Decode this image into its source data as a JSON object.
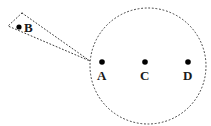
{
  "figure": {
    "background_color": "#ffffff",
    "stroke_color": "#3a3a3a",
    "dot_color": "#000000",
    "label_color": "#1a1a1a",
    "line_style": "dotted",
    "width": 211,
    "height": 126
  },
  "circle": {
    "name": "dotted-circle",
    "center_x": 148,
    "center_y": 66,
    "radius": 58,
    "stroke": "#3a3a3a",
    "stroke_width": 1,
    "dash": "1 2.6",
    "fill": "none"
  },
  "wedge": {
    "name": "dotted-wedge",
    "stroke": "#3a3a3a",
    "stroke_width": 1,
    "dash": "1 2.4",
    "fill": "none",
    "points": "22,13 8,26 90,61 90,61",
    "vertices": [
      {
        "label": "top-left",
        "x": 22,
        "y": 13
      },
      {
        "label": "bottom-left",
        "x": 8,
        "y": 26
      },
      {
        "label": "apex",
        "x": 90,
        "y": 61
      }
    ]
  },
  "points": [
    {
      "id": "B",
      "label": "B",
      "dot_x": 19,
      "dot_y": 27,
      "dot_r": 2.6,
      "label_x": 24,
      "label_y": 21,
      "inside_circle": false
    },
    {
      "id": "A",
      "label": "A",
      "dot_x": 102,
      "dot_y": 62,
      "dot_r": 2.8,
      "label_x": 97,
      "label_y": 69,
      "inside_circle": true
    },
    {
      "id": "C",
      "label": "C",
      "dot_x": 145,
      "dot_y": 62,
      "dot_r": 2.8,
      "label_x": 140,
      "label_y": 69,
      "inside_circle": true
    },
    {
      "id": "D",
      "label": "D",
      "dot_x": 188,
      "dot_y": 62,
      "dot_r": 2.8,
      "label_x": 183,
      "label_y": 69,
      "inside_circle": true
    }
  ]
}
